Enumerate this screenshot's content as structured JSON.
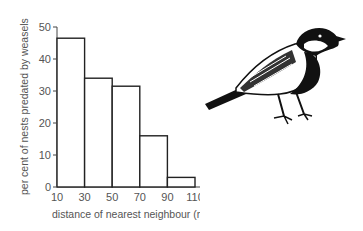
{
  "chart_data": {
    "type": "bar",
    "subtype": "histogram",
    "title": "",
    "xlabel": "distance of nearest neighbour (m)",
    "ylabel": "per cent of nests predated by weasels",
    "bin_edges": [
      10,
      30,
      50,
      70,
      90,
      110
    ],
    "categories": [
      "10-30",
      "30-50",
      "50-70",
      "70-90",
      "90-110"
    ],
    "values": [
      46.5,
      34,
      31.5,
      16,
      3
    ],
    "xticks": [
      10,
      30,
      50,
      70,
      90,
      110
    ],
    "yticks": [
      0,
      10,
      20,
      30,
      40,
      50
    ],
    "ylim": [
      0,
      50
    ],
    "xlim": [
      10,
      110
    ],
    "grid": false,
    "legend": null,
    "colors": {
      "bar_fill": "#ffffff",
      "bar_edge": "#222222",
      "axis": "#444444",
      "text": "#555555"
    }
  },
  "illustration": {
    "subject": "great-tit-bird"
  }
}
